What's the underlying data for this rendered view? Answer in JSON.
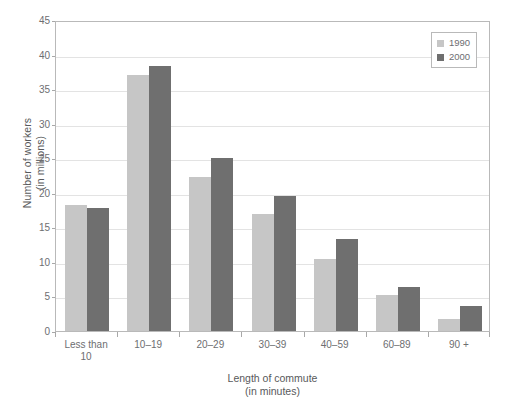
{
  "chart_data": {
    "type": "bar",
    "title": "",
    "subtitle": "",
    "xlabel": "Length of commute",
    "xlabel_line2": "(in minutes)",
    "ylabel": "Number of workers",
    "ylabel_line2": "(in millions)",
    "categories": [
      "Less than 10",
      "10–19",
      "20–29",
      "30–39",
      "40–59",
      "60–89",
      "90 +"
    ],
    "category_labels": [
      {
        "line1": "Less than",
        "line2": "10"
      },
      {
        "line1": "10–19",
        "line2": ""
      },
      {
        "line1": "20–29",
        "line2": ""
      },
      {
        "line1": "30–39",
        "line2": ""
      },
      {
        "line1": "40–59",
        "line2": ""
      },
      {
        "line1": "60–89",
        "line2": ""
      },
      {
        "line1": "90 +",
        "line2": ""
      }
    ],
    "series": [
      {
        "name": "1990",
        "color": "#c6c6c6",
        "values": [
          18.3,
          37.0,
          22.3,
          17.0,
          10.4,
          5.2,
          1.8
        ]
      },
      {
        "name": "2000",
        "color": "#6f6f6f",
        "values": [
          17.8,
          38.3,
          25.0,
          19.5,
          13.3,
          6.4,
          3.6
        ]
      }
    ],
    "ylim": [
      0,
      45
    ],
    "yticks": [
      0,
      5,
      10,
      15,
      20,
      25,
      30,
      35,
      40,
      45
    ],
    "ytick_labels": [
      "0",
      "5",
      "10",
      "15",
      "20",
      "25",
      "30",
      "35",
      "40",
      "45"
    ],
    "grid": true,
    "grid_axis": "y",
    "legend_position": "top-right",
    "legend_entries": [
      "1990",
      "2000"
    ]
  },
  "colors": {
    "series_1990": "#c6c6c6",
    "series_2000": "#6f6f6f",
    "gridline": "#e3e3e3",
    "axis": "#b9b9b9",
    "text": "#58595b",
    "tick_text": "#6d6e71",
    "background": "#ffffff"
  }
}
